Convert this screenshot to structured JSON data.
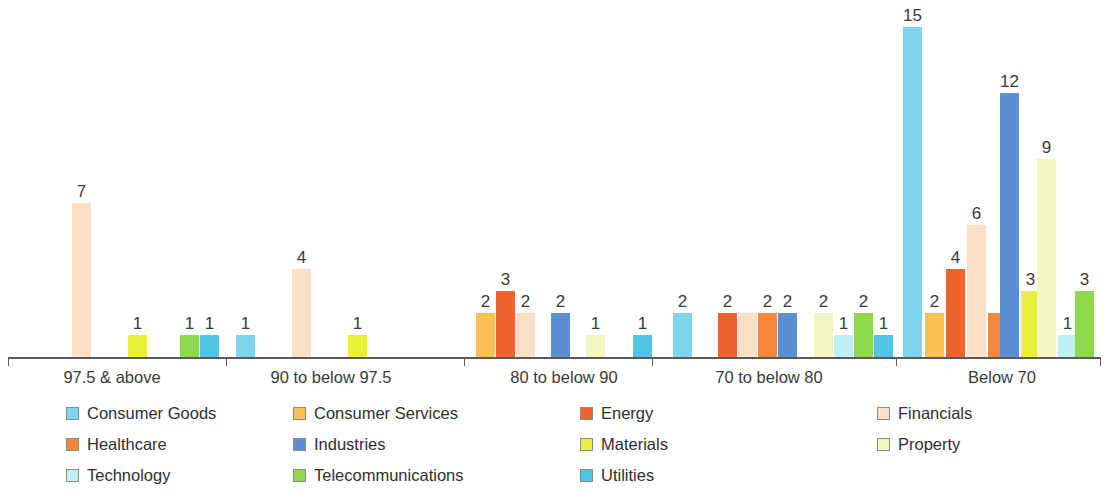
{
  "chart_data": {
    "type": "bar",
    "title": "",
    "subtitle": "",
    "xlabel": "",
    "ylabel": "",
    "grid": false,
    "legend_position": "bottom",
    "ylim": [
      0,
      15
    ],
    "axis_visible": "x-only",
    "categories": [
      "97.5 & above",
      "90 to below 97.5",
      "80 to below 90",
      "70 to below 80",
      "Below 70"
    ],
    "series": [
      {
        "name": "Consumer Goods",
        "color": "#7FD4F0",
        "values": [
          0,
          1,
          0,
          2,
          15
        ]
      },
      {
        "name": "Consumer Services",
        "color": "#FBBF52",
        "values": [
          0,
          0,
          2,
          0,
          2
        ]
      },
      {
        "name": "Energy",
        "color": "#F0622E",
        "values": [
          0,
          0,
          3,
          2,
          4
        ]
      },
      {
        "name": "Financials",
        "color": "#FBDFC6",
        "values": [
          7,
          4,
          2,
          2,
          6
        ]
      },
      {
        "name": "Healthcare",
        "color": "#F5883A",
        "values": [
          0,
          0,
          0,
          2,
          2
        ]
      },
      {
        "name": "Industries",
        "color": "#5B8FD4",
        "values": [
          0,
          0,
          2,
          2,
          12
        ]
      },
      {
        "name": "Materials",
        "color": "#E8F03A",
        "values": [
          1,
          1,
          0,
          0,
          3
        ]
      },
      {
        "name": "Property",
        "color": "#F2F5C0",
        "values": [
          0,
          0,
          1,
          2,
          9
        ]
      },
      {
        "name": "Technology",
        "color": "#BFF0F5",
        "values": [
          0,
          0,
          0,
          1,
          1
        ]
      },
      {
        "name": "Telecommunications",
        "color": "#8DD94A",
        "values": [
          1,
          0,
          0,
          2,
          3
        ]
      },
      {
        "name": "Utilities",
        "color": "#52C4E8",
        "values": [
          1,
          0,
          1,
          1,
          0
        ]
      }
    ],
    "hidden_labels": [
      {
        "category": "70 to below 80",
        "series": "Financials",
        "value": 2
      },
      {
        "category": "Below 70",
        "series": "Healthcare",
        "value": 2
      }
    ]
  },
  "legend": {
    "items": [
      {
        "label": "Consumer Goods"
      },
      {
        "label": "Consumer Services"
      },
      {
        "label": "Energy"
      },
      {
        "label": "Financials"
      },
      {
        "label": "Healthcare"
      },
      {
        "label": "Industries"
      },
      {
        "label": "Materials"
      },
      {
        "label": "Property"
      },
      {
        "label": "Technology"
      },
      {
        "label": "Telecommunications"
      },
      {
        "label": "Utilities"
      }
    ]
  }
}
